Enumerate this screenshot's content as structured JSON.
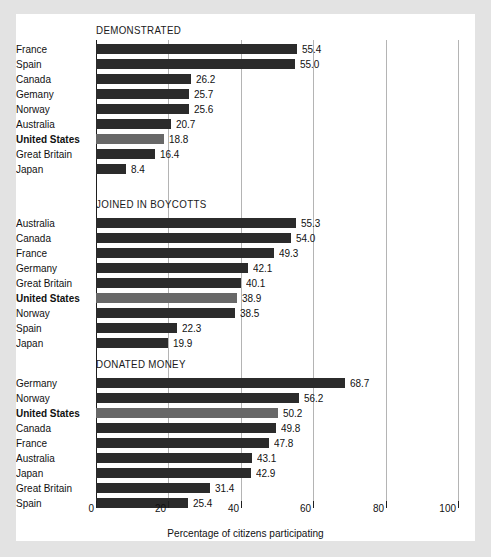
{
  "chart_data": {
    "type": "bar",
    "orientation": "horizontal",
    "title": "",
    "xlabel": "Percentage of citizens participating",
    "ylabel": "",
    "xlim": [
      0,
      100
    ],
    "xticks": [
      0,
      20,
      40,
      60,
      80,
      100
    ],
    "xtick_labels": [
      "0",
      "20",
      "40",
      "60",
      "80",
      "100"
    ],
    "grid": "vertical",
    "legend": "none",
    "highlight_category": "United States",
    "colors": {
      "bar": "#2b2b2b",
      "bar_highlight": "#686868",
      "gridline": "#b4b4b4",
      "axis": "#1e1e1e",
      "panel_background": "#ffffff",
      "page_background": "#e3e3e3",
      "text": "#111111"
    },
    "panels": [
      {
        "title": "DEMONSTRATED",
        "categories": [
          "France",
          "Spain",
          "Gemany",
          "Norway",
          "Australia",
          "United States",
          "Great Britain",
          "Japan"
        ],
        "rows": [
          {
            "label": "France",
            "value": 55.4,
            "value_label": "55.4",
            "highlight": false
          },
          {
            "label": "Spain",
            "value": 55.0,
            "value_label": "55.0",
            "highlight": false
          },
          {
            "label": "Canada",
            "value": 26.2,
            "value_label": "26.2",
            "highlight": false
          },
          {
            "label": "Gemany",
            "value": 25.7,
            "value_label": "25.7",
            "highlight": false
          },
          {
            "label": "Norway",
            "value": 25.6,
            "value_label": "25.6",
            "highlight": false
          },
          {
            "label": "Australia",
            "value": 20.7,
            "value_label": "20.7",
            "highlight": false
          },
          {
            "label": "United States",
            "value": 18.8,
            "value_label": "18.8",
            "highlight": true
          },
          {
            "label": "Great Britain",
            "value": 16.4,
            "value_label": "16.4",
            "highlight": false
          },
          {
            "label": "Japan",
            "value": 8.4,
            "value_label": "8.4",
            "highlight": false
          }
        ]
      },
      {
        "title": "JOINED IN BOYCOTTS",
        "categories": [
          "Australia",
          "Canada",
          "France",
          "Germany",
          "Great Britain",
          "United States",
          "Norway",
          "Spain",
          "Japan"
        ],
        "rows": [
          {
            "label": "Australia",
            "value": 55.3,
            "value_label": "55.3",
            "highlight": false
          },
          {
            "label": "Canada",
            "value": 54.0,
            "value_label": "54.0",
            "highlight": false
          },
          {
            "label": "France",
            "value": 49.3,
            "value_label": "49.3",
            "highlight": false
          },
          {
            "label": "Germany",
            "value": 42.1,
            "value_label": "42.1",
            "highlight": false
          },
          {
            "label": "Great Britain",
            "value": 40.1,
            "value_label": "40.1",
            "highlight": false
          },
          {
            "label": "United States",
            "value": 38.9,
            "value_label": "38.9",
            "highlight": true
          },
          {
            "label": "Norway",
            "value": 38.5,
            "value_label": "38.5",
            "highlight": false
          },
          {
            "label": "Spain",
            "value": 22.3,
            "value_label": "22.3",
            "highlight": false
          },
          {
            "label": "Japan",
            "value": 19.9,
            "value_label": "19.9",
            "highlight": false
          }
        ]
      },
      {
        "title": "DONATED MONEY",
        "categories": [
          "Germany",
          "Norway",
          "United States",
          "Canada",
          "France",
          "Australia",
          "Japan",
          "Great Britain",
          "Spain"
        ],
        "rows": [
          {
            "label": "Germany",
            "value": 68.7,
            "value_label": "68.7",
            "highlight": false
          },
          {
            "label": "Norway",
            "value": 56.2,
            "value_label": "56.2",
            "highlight": false
          },
          {
            "label": "United States",
            "value": 50.2,
            "value_label": "50.2",
            "highlight": true
          },
          {
            "label": "Canada",
            "value": 49.8,
            "value_label": "49.8",
            "highlight": false
          },
          {
            "label": "France",
            "value": 47.8,
            "value_label": "47.8",
            "highlight": false
          },
          {
            "label": "Australia",
            "value": 43.1,
            "value_label": "43.1",
            "highlight": false
          },
          {
            "label": "Japan",
            "value": 42.9,
            "value_label": "42.9",
            "highlight": false
          },
          {
            "label": "Great Britain",
            "value": 31.4,
            "value_label": "31.4",
            "highlight": false
          },
          {
            "label": "Spain",
            "value": 25.4,
            "value_label": "25.4",
            "highlight": false
          }
        ]
      }
    ]
  }
}
